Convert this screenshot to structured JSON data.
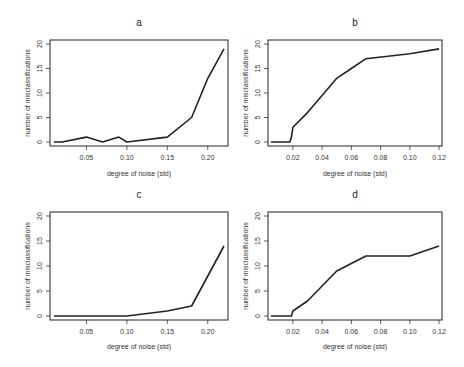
{
  "chart_data": [
    {
      "type": "line",
      "title": "a",
      "xlabel": "degree of noise (std)",
      "ylabel": "number of misclassifications",
      "xlim": [
        0.005,
        0.225
      ],
      "ylim": [
        0,
        20
      ],
      "xticks": [
        0.05,
        0.1,
        0.15,
        0.2
      ],
      "xtick_labels": [
        "0.05",
        "0.10",
        "0.15",
        "0.20"
      ],
      "yticks": [
        0,
        5,
        10,
        15,
        20
      ],
      "ytick_labels": [
        "0",
        "5",
        "10",
        "15",
        "20"
      ],
      "grid": false,
      "series": [
        {
          "name": "misclassifications",
          "x": [
            0.01,
            0.02,
            0.05,
            0.07,
            0.09,
            0.1,
            0.15,
            0.18,
            0.2,
            0.22
          ],
          "y": [
            0,
            0,
            1,
            0,
            1,
            0,
            1,
            5,
            13,
            19
          ]
        }
      ]
    },
    {
      "type": "line",
      "title": "b",
      "xlabel": "degree of noise (std)",
      "ylabel": "number of misclassifications",
      "xlim": [
        0.003,
        0.122
      ],
      "ylim": [
        0,
        20
      ],
      "xticks": [
        0.02,
        0.04,
        0.06,
        0.08,
        0.1,
        0.12
      ],
      "xtick_labels": [
        "0.02",
        "0.04",
        "0.06",
        "0.08",
        "0.10",
        "0.12"
      ],
      "yticks": [
        0,
        5,
        10,
        15,
        20
      ],
      "ytick_labels": [
        "0",
        "5",
        "10",
        "15",
        "20"
      ],
      "grid": false,
      "series": [
        {
          "name": "misclassifications",
          "x": [
            0.005,
            0.018,
            0.019,
            0.02,
            0.03,
            0.04,
            0.05,
            0.06,
            0.07,
            0.1,
            0.12
          ],
          "y": [
            0,
            0,
            1,
            3,
            6,
            9.5,
            13,
            15,
            17,
            18,
            19
          ]
        }
      ]
    },
    {
      "type": "line",
      "title": "c",
      "xlabel": "degree of noise (std)",
      "ylabel": "number of misclassifications",
      "xlim": [
        0.005,
        0.225
      ],
      "ylim": [
        0,
        20
      ],
      "xticks": [
        0.05,
        0.1,
        0.15,
        0.2
      ],
      "xtick_labels": [
        "0.05",
        "0.10",
        "0.15",
        "0.20"
      ],
      "yticks": [
        0,
        5,
        10,
        15,
        20
      ],
      "ytick_labels": [
        "0",
        "5",
        "10",
        "15",
        "20"
      ],
      "grid": false,
      "series": [
        {
          "name": "misclassifications",
          "x": [
            0.01,
            0.05,
            0.1,
            0.15,
            0.18,
            0.2,
            0.22
          ],
          "y": [
            0,
            0,
            0,
            1,
            2,
            8,
            14
          ]
        }
      ]
    },
    {
      "type": "line",
      "title": "d",
      "xlabel": "degree of noise (std)",
      "ylabel": "number of misclassifications",
      "xlim": [
        0.003,
        0.122
      ],
      "ylim": [
        0,
        20
      ],
      "xticks": [
        0.02,
        0.04,
        0.06,
        0.08,
        0.1,
        0.12
      ],
      "xtick_labels": [
        "0.02",
        "0.04",
        "0.06",
        "0.08",
        "0.10",
        "0.12"
      ],
      "yticks": [
        0,
        5,
        10,
        15,
        20
      ],
      "ytick_labels": [
        "0",
        "5",
        "10",
        "15",
        "20"
      ],
      "grid": false,
      "series": [
        {
          "name": "misclassifications",
          "x": [
            0.005,
            0.019,
            0.02,
            0.03,
            0.04,
            0.05,
            0.06,
            0.07,
            0.1,
            0.12
          ],
          "y": [
            0,
            0,
            1,
            3,
            6,
            9,
            10.5,
            12,
            12,
            14
          ]
        }
      ]
    }
  ]
}
